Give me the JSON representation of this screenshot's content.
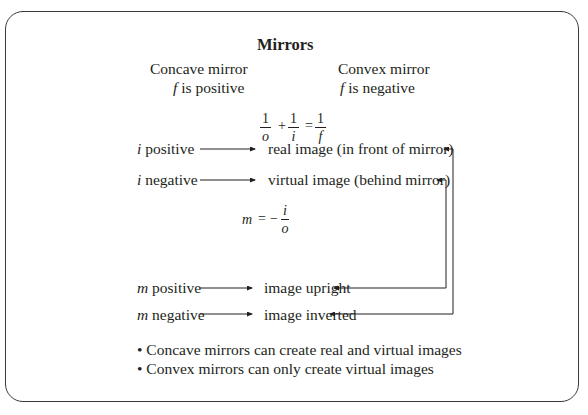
{
  "title": "Mirrors",
  "columns": [
    {
      "name": "Concave mirror",
      "var": "f",
      "desc": "is positive"
    },
    {
      "name": "Convex mirror",
      "var": "f",
      "desc": "is negative"
    }
  ],
  "equation1": {
    "terms": [
      {
        "num": "1",
        "den": "o"
      },
      {
        "num": "1",
        "den": "i"
      },
      {
        "num": "1",
        "den": "f"
      }
    ],
    "plus": "+",
    "equals": "="
  },
  "rows_i": [
    {
      "var": "i",
      "label": "positive",
      "result": "real image (in front of mirror)"
    },
    {
      "var": "i",
      "label": "negative",
      "result": "virtual image (behind mirror)"
    }
  ],
  "equation2": {
    "lhs": "m",
    "equals": "=",
    "minus": "−",
    "num": "i",
    "den": "o"
  },
  "rows_m": [
    {
      "var": "m",
      "label": "positive",
      "result": "image upright"
    },
    {
      "var": "m",
      "label": "negative",
      "result": "image inverted"
    }
  ],
  "bullets": [
    "Concave mirrors can create real and virtual images",
    "Convex mirrors can only create virtual images"
  ],
  "bullet_char": "•"
}
